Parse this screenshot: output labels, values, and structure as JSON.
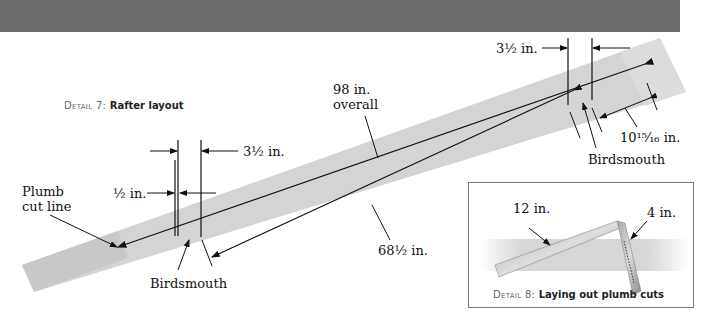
{
  "detail7": {
    "caption_prefix": "Detail 7:",
    "caption": "Rafter layout",
    "labels": {
      "overall_line1": "98 in.",
      "overall_line2": "overall",
      "top_seat_left": "3½ in.",
      "top_seat_right": "3½ in.",
      "half_inch": "½ in.",
      "plumb_line1": "Plumb",
      "plumb_line2": "cut line",
      "birdsmouth_left": "Birdsmouth",
      "birdsmouth_right": "Birdsmouth",
      "run_length": "68½ in.",
      "tail_length": "10¹⁵⁄₁₆ in."
    }
  },
  "detail8": {
    "caption_prefix": "Detail 8:",
    "caption": "Laying out plumb cuts",
    "labels": {
      "blade": "12 in.",
      "tongue": "4 in."
    }
  },
  "colors": {
    "header_bar": "#6a6a6a",
    "rafter": "#d4d4d4",
    "line": "#111111"
  }
}
